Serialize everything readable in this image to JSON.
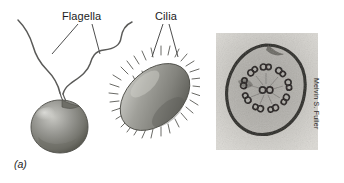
{
  "figure": {
    "background_color": "#ffffff",
    "panels": [
      {
        "id": "a",
        "caption": "(a)",
        "kind": "illustration",
        "description": "Line-and-wash drawing comparing a flagellated cell with two long wavy flagella to an oval ciliated cell covered in short cilia",
        "labels": [
          {
            "name": "flagella-label",
            "text": "Flagella",
            "points_to": "two long whip-like appendages of the round cell"
          },
          {
            "name": "cilia-label",
            "text": "Cilia",
            "points_to": "short hair-like projections covering the oval cell"
          }
        ],
        "organisms": [
          {
            "name": "flagellated-cell",
            "body_shape": "spherical",
            "appendage_type": "flagella",
            "appendage_count": 2,
            "appendage_length": "long",
            "body_fill": "#8a8a86",
            "body_shadow": "#5e5e5a",
            "body_highlight": "#c2c2bd"
          },
          {
            "name": "ciliated-cell",
            "body_shape": "ovoid",
            "appendage_type": "cilia",
            "appendage_count": "numerous",
            "appendage_length": "short",
            "body_fill": "#8f8f8a",
            "body_shadow": "#63635f",
            "body_highlight": "#c6c6c1"
          }
        ]
      },
      {
        "id": "b",
        "caption": "(b)",
        "kind": "micrograph",
        "description": "Transmission electron micrograph of a cross-section through a flagellum showing the 9+2 axoneme arrangement",
        "credit": "Melvin S. Fuller",
        "micrograph": {
          "membrane_outline": "dark irregular ring",
          "outer_doublets": 9,
          "central_pair": 2,
          "film_tone_light": "#d6d4cf",
          "film_tone_mid": "#a9a7a2",
          "film_tone_dark": "#2e2c2a"
        }
      }
    ],
    "colors": {
      "ink": "#1c1c1c",
      "leader_line": "#3a3a3a",
      "paper": "#ffffff"
    }
  }
}
